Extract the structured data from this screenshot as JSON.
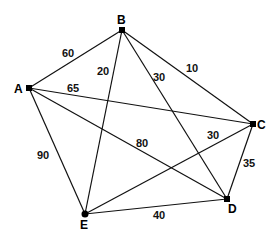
{
  "graph": {
    "title": "Weighted complete graph on five vertices",
    "nodes": [
      {
        "id": "A",
        "label": "A",
        "x": 29,
        "y": 88
      },
      {
        "id": "B",
        "label": "B",
        "x": 122,
        "y": 30
      },
      {
        "id": "C",
        "label": "C",
        "x": 253,
        "y": 124
      },
      {
        "id": "D",
        "label": "D",
        "x": 227,
        "y": 199
      },
      {
        "id": "E",
        "label": "E",
        "x": 85,
        "y": 214
      }
    ],
    "edges": [
      {
        "from": "A",
        "to": "B",
        "weight": "60"
      },
      {
        "from": "A",
        "to": "C",
        "weight": "65"
      },
      {
        "from": "A",
        "to": "D",
        "weight": "80"
      },
      {
        "from": "A",
        "to": "E",
        "weight": "90"
      },
      {
        "from": "B",
        "to": "C",
        "weight": "10"
      },
      {
        "from": "B",
        "to": "D",
        "weight": "30"
      },
      {
        "from": "B",
        "to": "E",
        "weight": "20"
      },
      {
        "from": "C",
        "to": "D",
        "weight": "35"
      },
      {
        "from": "C",
        "to": "E",
        "weight": "30"
      },
      {
        "from": "D",
        "to": "E",
        "weight": "40"
      }
    ]
  }
}
